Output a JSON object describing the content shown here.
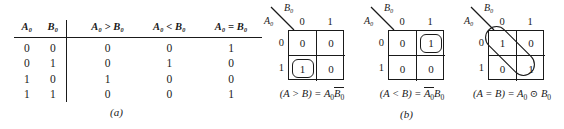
{
  "figure": {
    "part_a_caption": "(a)",
    "part_b_caption": "(b)"
  },
  "truth_table": {
    "headers": [
      "A₀",
      "B₀",
      "A₀ > B₀",
      "A₀ < B₀",
      "A₀ = B₀"
    ],
    "rows": [
      {
        "a": "0",
        "b": "0",
        "gt": "0",
        "lt": "0",
        "eq": "1"
      },
      {
        "a": "0",
        "b": "1",
        "gt": "0",
        "lt": "1",
        "eq": "0"
      },
      {
        "a": "1",
        "b": "0",
        "gt": "1",
        "lt": "0",
        "eq": "0"
      },
      {
        "a": "1",
        "b": "1",
        "gt": "0",
        "lt": "0",
        "eq": "1"
      }
    ]
  },
  "kmaps": [
    {
      "name": "a-greater-than-b",
      "col_var": "B₀",
      "row_var": "A₀",
      "col_headers": [
        "0",
        "1"
      ],
      "row_headers": [
        "0",
        "1"
      ],
      "cells": [
        [
          "0",
          "0"
        ],
        [
          "1",
          "0"
        ]
      ],
      "equation_lhs": "(A > B) =",
      "equation_rhs_a": "A₀",
      "equation_rhs_b": "B₀",
      "loop": "bottom-left-cell"
    },
    {
      "name": "a-less-than-b",
      "col_var": "B₀",
      "row_var": "A₀",
      "col_headers": [
        "0",
        "1"
      ],
      "row_headers": [
        "0",
        "1"
      ],
      "cells": [
        [
          "0",
          "1"
        ],
        [
          "0",
          "0"
        ]
      ],
      "equation_lhs": "(A < B) =",
      "equation_rhs_a": "A₀",
      "equation_rhs_b": "B₀",
      "loop": "top-right-cell"
    },
    {
      "name": "a-equals-b",
      "col_var": "B₀",
      "row_var": "A₀",
      "col_headers": [
        "0",
        "1"
      ],
      "row_headers": [
        "0",
        "1"
      ],
      "cells": [
        [
          "1",
          "0"
        ],
        [
          "0",
          "1"
        ]
      ],
      "equation_lhs": "(A = B) =",
      "equation_rhs_a": "A₀",
      "equation_operator": "⊙",
      "equation_rhs_b": "B₀",
      "loop": "diagonal"
    }
  ],
  "colors": {
    "ink": "#1a1a1a",
    "background": "#ffffff"
  }
}
